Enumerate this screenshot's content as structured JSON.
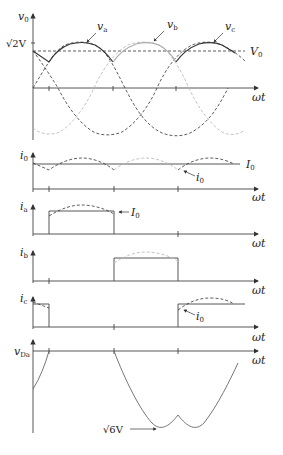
{
  "figure": {
    "panels": [
      {
        "id": "v0",
        "ylabel": "v",
        "ysub": "0",
        "xlabel": "ωt",
        "ytick_label": "√2V",
        "annotations": [
          "v_a",
          "v_b",
          "v_c",
          "V_0"
        ]
      },
      {
        "id": "i0",
        "ylabel": "i",
        "ysub": "0",
        "xlabel": "ωt",
        "annotations": [
          "I_0",
          "i_0"
        ]
      },
      {
        "id": "ia",
        "ylabel": "i",
        "ysub": "a",
        "xlabel": "ωt",
        "annotations": [
          "I_0"
        ]
      },
      {
        "id": "ib",
        "ylabel": "i",
        "ysub": "b",
        "xlabel": "ωt",
        "annotations": []
      },
      {
        "id": "ic",
        "ylabel": "i",
        "ysub": "c",
        "xlabel": "ωt",
        "annotations": [
          "i_0"
        ]
      },
      {
        "id": "vDa",
        "ylabel": "v",
        "ysub": "Da",
        "xlabel": "ωt",
        "annotations": [
          "√6V"
        ]
      }
    ],
    "labels": {
      "v0_axis": "v",
      "v0_sub": "0",
      "sqrt2V": "√2V",
      "va": "v",
      "va_sub": "a",
      "vb": "v",
      "vb_sub": "b",
      "vc": "v",
      "vc_sub": "c",
      "V0": "V",
      "V0_sub": "0",
      "wt": "ωt",
      "i0_axis": "i",
      "i0_sub": "0",
      "I0": "I",
      "I0_sub": "0",
      "i0_small": "i",
      "i0_small_sub": "0",
      "ia_axis": "i",
      "ia_sub": "a",
      "ib_axis": "i",
      "ib_sub": "b",
      "ic_axis": "i",
      "ic_sub": "c",
      "vDa_axis": "v",
      "vDa_sub": "Da",
      "sqrt6V": "√6V"
    },
    "colors": {
      "va": "#333333",
      "vb": "#b8b8b8",
      "vc": "#333333",
      "axis": "#444444"
    }
  }
}
